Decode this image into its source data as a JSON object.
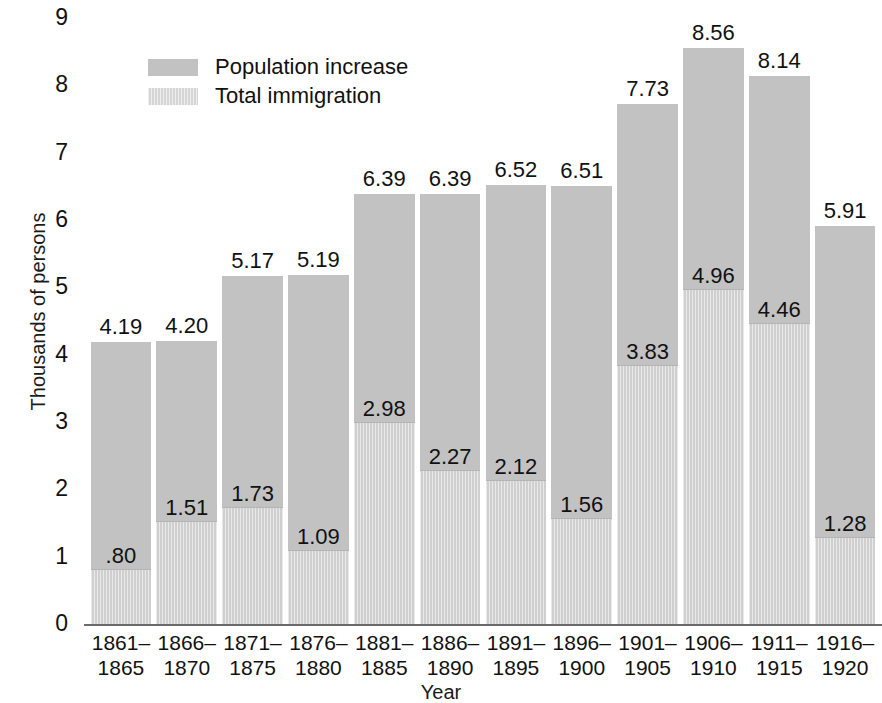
{
  "chart_data": {
    "type": "bar",
    "subtype": "stacked-bar",
    "title": "",
    "xlabel": "Year",
    "ylabel": "Thousands of persons",
    "ylim": [
      0,
      9
    ],
    "yticks": [
      "0",
      "1",
      "2",
      "3",
      "4",
      "5",
      "6",
      "7",
      "8",
      "9"
    ],
    "grid": false,
    "legend_position": "top-left-inside",
    "categories": [
      "1861–\n1865",
      "1866–\n1870",
      "1871–\n1875",
      "1876–\n1880",
      "1881–\n1885",
      "1886–\n1890",
      "1891–\n1895",
      "1896–\n1900",
      "1901–\n1905",
      "1906–\n1910",
      "1911–\n1915",
      "1916–\n1920"
    ],
    "series": [
      {
        "name": "Population increase",
        "color": "#c2c2c2",
        "values": [
          4.19,
          4.2,
          5.17,
          5.19,
          6.39,
          6.39,
          6.52,
          6.51,
          7.73,
          8.56,
          8.14,
          5.91
        ],
        "labels": [
          "4.19",
          "4.20",
          "5.17",
          "5.19",
          "6.39",
          "6.39",
          "6.52",
          "6.51",
          "7.73",
          "8.56",
          "8.14",
          "5.91"
        ]
      },
      {
        "name": "Total immigration",
        "color": "#d5d5d5",
        "values": [
          0.8,
          1.51,
          1.73,
          1.09,
          2.98,
          2.27,
          2.12,
          1.56,
          3.83,
          4.96,
          4.46,
          1.28
        ],
        "labels": [
          ".80",
          "1.51",
          "1.73",
          "1.09",
          "2.98",
          "2.27",
          "2.12",
          "1.56",
          "3.83",
          "4.96",
          "4.46",
          "1.28"
        ]
      }
    ],
    "bars": [
      {
        "period_start": "1861–",
        "period_end": "1865",
        "total": 4.19,
        "total_label": "4.19",
        "immigration": 0.8,
        "immigration_label": ".80"
      },
      {
        "period_start": "1866–",
        "period_end": "1870",
        "total": 4.2,
        "total_label": "4.20",
        "immigration": 1.51,
        "immigration_label": "1.51"
      },
      {
        "period_start": "1871–",
        "period_end": "1875",
        "total": 5.17,
        "total_label": "5.17",
        "immigration": 1.73,
        "immigration_label": "1.73"
      },
      {
        "period_start": "1876–",
        "period_end": "1880",
        "total": 5.19,
        "total_label": "5.19",
        "immigration": 1.09,
        "immigration_label": "1.09"
      },
      {
        "period_start": "1881–",
        "period_end": "1885",
        "total": 6.39,
        "total_label": "6.39",
        "immigration": 2.98,
        "immigration_label": "2.98"
      },
      {
        "period_start": "1886–",
        "period_end": "1890",
        "total": 6.39,
        "total_label": "6.39",
        "immigration": 2.27,
        "immigration_label": "2.27"
      },
      {
        "period_start": "1891–",
        "period_end": "1895",
        "total": 6.52,
        "total_label": "6.52",
        "immigration": 2.12,
        "immigration_label": "2.12"
      },
      {
        "period_start": "1896–",
        "period_end": "1900",
        "total": 6.51,
        "total_label": "6.51",
        "immigration": 1.56,
        "immigration_label": "1.56"
      },
      {
        "period_start": "1901–",
        "period_end": "1905",
        "total": 7.73,
        "total_label": "7.73",
        "immigration": 3.83,
        "immigration_label": "3.83"
      },
      {
        "period_start": "1906–",
        "period_end": "1910",
        "total": 8.56,
        "total_label": "8.56",
        "immigration": 4.96,
        "immigration_label": "4.96"
      },
      {
        "period_start": "1911–",
        "period_end": "1915",
        "total": 8.14,
        "total_label": "8.14",
        "immigration": 4.46,
        "immigration_label": "4.46"
      },
      {
        "period_start": "1916–",
        "period_end": "1920",
        "total": 5.91,
        "total_label": "5.91",
        "immigration": 1.28,
        "immigration_label": "1.28"
      }
    ]
  },
  "legend": {
    "items": [
      {
        "label": "Population increase",
        "color": "#c2c2c2"
      },
      {
        "label": "Total immigration",
        "color": "#d5d5d5"
      }
    ]
  },
  "axes": {
    "y_title": "Thousands of persons",
    "x_title": "Year"
  }
}
